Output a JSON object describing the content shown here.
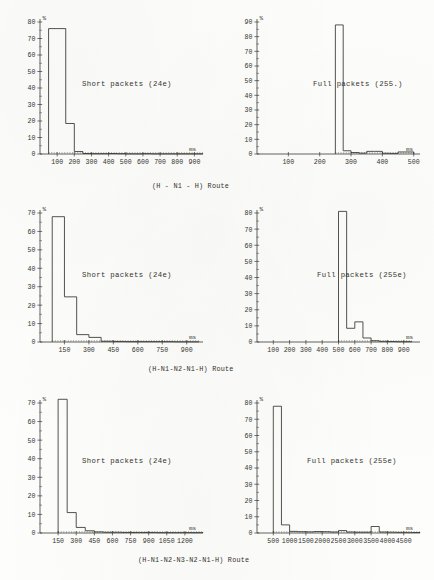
{
  "figure": {
    "kind": "scanned-figure",
    "ink_color": "#35352f",
    "paper_color": "#fdfdfb",
    "percent_symbol": "%",
    "time_unit": "ms",
    "route_word": "Route"
  },
  "captions": [
    {
      "id": "caption-row-1",
      "text": "(H - N1 - H)  Route"
    },
    {
      "id": "caption-row-2",
      "text": "(H-N1-N2-N1-H)  Route"
    },
    {
      "id": "caption-row-3",
      "text": "(H-N1-N2-N3-N2-N1-H)  Route"
    }
  ],
  "chart_data": [
    {
      "id": "chart-short-24e-hop1",
      "type": "bar",
      "title": "Short packets (24e)",
      "xlabel": "ms",
      "ylabel": "%",
      "xlim": [
        0,
        950
      ],
      "ylim": [
        0,
        80
      ],
      "xticks": [
        100,
        200,
        300,
        400,
        500,
        600,
        700,
        800,
        900
      ],
      "yticks": [
        0,
        10,
        20,
        30,
        40,
        50,
        60,
        70,
        80
      ],
      "bin_width": 50,
      "bin_starts": [
        50,
        100,
        150,
        200,
        250,
        300,
        350,
        400,
        450,
        500,
        550,
        600,
        650,
        700,
        750,
        800,
        850,
        900
      ],
      "values": [
        76,
        76,
        18.5,
        1.5,
        0.3,
        0.2,
        0.2,
        0.3,
        0.2,
        0.1,
        0.1,
        0.2,
        0.1,
        0.1,
        0.1,
        0.1,
        0.1,
        0.1
      ],
      "grid": false,
      "legend": "none"
    },
    {
      "id": "chart-full-255-hop1",
      "type": "bar",
      "title": "Full packets (255.)",
      "xlabel": "ms",
      "ylabel": "%",
      "xlim": [
        0,
        520
      ],
      "ylim": [
        0,
        90
      ],
      "xticks": [
        100,
        200,
        300,
        400,
        500
      ],
      "yticks": [
        0,
        10,
        20,
        30,
        40,
        50,
        60,
        70,
        80,
        90
      ],
      "bin_width": 25,
      "bin_starts": [
        250,
        275,
        300,
        325,
        350,
        375,
        400,
        425,
        450,
        475
      ],
      "values": [
        88,
        2.2,
        1.0,
        0.6,
        1.8,
        1.8,
        0.5,
        0.4,
        1.4,
        1.4
      ],
      "grid": false,
      "legend": "none"
    },
    {
      "id": "chart-short-24e-hop2",
      "type": "bar",
      "title": "Short packets (24e)",
      "xlabel": "ms",
      "ylabel": "%",
      "xlim": [
        0,
        1000
      ],
      "ylim": [
        0,
        70
      ],
      "xticks": [
        150,
        300,
        450,
        600,
        750,
        900
      ],
      "yticks": [
        0,
        10,
        20,
        30,
        40,
        50,
        60,
        70
      ],
      "bin_width": 75,
      "bin_starts": [
        75,
        150,
        225,
        300,
        375,
        450,
        525,
        600,
        675,
        750,
        825,
        900
      ],
      "values": [
        68,
        24.5,
        4.0,
        2.5,
        0.4,
        0.3,
        0.2,
        0.2,
        0.2,
        0.2,
        0.1,
        0.1
      ],
      "grid": false,
      "legend": "none"
    },
    {
      "id": "chart-full-255e-hop2",
      "type": "bar",
      "title": "Full packets (255e)",
      "xlabel": "ms",
      "ylabel": "%",
      "xlim": [
        0,
        1000
      ],
      "ylim": [
        0,
        80
      ],
      "xticks": [
        100,
        200,
        300,
        400,
        500,
        600,
        700,
        800,
        900
      ],
      "yticks": [
        0,
        10,
        20,
        30,
        40,
        50,
        60,
        70,
        80
      ],
      "bin_width": 50,
      "bin_starts": [
        500,
        550,
        600,
        650,
        700,
        750,
        800,
        850,
        900
      ],
      "values": [
        81,
        8.5,
        12.5,
        2.5,
        0.8,
        0.4,
        0.3,
        0.2,
        0.2
      ],
      "grid": false,
      "legend": "none"
    },
    {
      "id": "chart-short-24e-hop3",
      "type": "bar",
      "title": "Short packets (24e)",
      "xlabel": "ms",
      "ylabel": "%",
      "xlim": [
        0,
        1350
      ],
      "ylim": [
        0,
        70
      ],
      "xticks": [
        150,
        300,
        450,
        600,
        750,
        900,
        1050,
        1200
      ],
      "yticks": [
        0,
        10,
        20,
        30,
        40,
        50,
        60,
        70
      ],
      "bin_width": 75,
      "bin_starts": [
        150,
        225,
        300,
        375,
        450,
        525,
        600,
        675,
        750,
        825,
        900,
        975,
        1050,
        1125,
        1200,
        1275
      ],
      "values": [
        72,
        11,
        3.0,
        1.2,
        0.6,
        0.4,
        0.4,
        0.3,
        0.3,
        0.3,
        0.3,
        0.2,
        0.2,
        0.2,
        0.2,
        0.2
      ],
      "grid": false,
      "legend": "none"
    },
    {
      "id": "chart-full-255e-hop3",
      "type": "bar",
      "title": "Full packets (255e)",
      "xlabel": "ms",
      "ylabel": "%",
      "xlim": [
        0,
        5000
      ],
      "ylim": [
        0,
        80
      ],
      "xticks": [
        500,
        1000,
        1500,
        2000,
        2500,
        3000,
        3500,
        4000,
        4500
      ],
      "yticks": [
        0,
        10,
        20,
        30,
        40,
        50,
        60,
        70,
        80
      ],
      "bin_width": 250,
      "bin_starts": [
        500,
        750,
        1000,
        1250,
        1500,
        1750,
        2000,
        2250,
        2500,
        2750,
        3000,
        3250,
        3500,
        3750,
        4000,
        4250,
        4500,
        4750
      ],
      "values": [
        78,
        5.0,
        1.0,
        0.8,
        0.7,
        0.9,
        0.8,
        0.6,
        1.5,
        0.6,
        0.5,
        0.5,
        4.0,
        0.6,
        0.5,
        0.4,
        0.4,
        0.3
      ],
      "grid": false,
      "legend": "none"
    }
  ]
}
